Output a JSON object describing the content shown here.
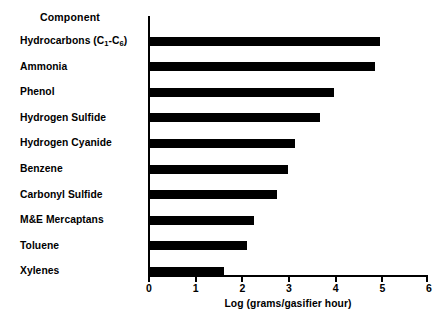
{
  "chart_data": {
    "type": "bar",
    "orientation": "horizontal",
    "title": "",
    "xlabel": "Log (grams/gasifier hour)",
    "ylabel": "Component",
    "categories": [
      "Hydrocarbons (C1-C6)",
      "Ammonia",
      "Phenol",
      "Hydrogen Sulfide",
      "Hydrogen Cyanide",
      "Benzene",
      "Carbonyl Sulfide",
      "M&E Mercaptans",
      "Toluene",
      "Xylenes"
    ],
    "values": [
      5.0,
      4.9,
      4.0,
      3.7,
      3.15,
      3.0,
      2.75,
      2.25,
      2.1,
      1.6
    ],
    "xlim": [
      0,
      6
    ],
    "xticks": [
      "0",
      "1",
      "2",
      "3",
      "4",
      "5",
      "6"
    ],
    "grid": false,
    "legend": false,
    "bar_color": "#000000",
    "background_color": "#ffffff"
  },
  "labels": {
    "component_header": "Component",
    "categories_display": [
      {
        "pre": "Hydrocarbons (C",
        "sub1": "1",
        "mid": "-C",
        "sub2": "6",
        "post": ")"
      },
      {
        "pre": "Ammonia"
      },
      {
        "pre": "Phenol"
      },
      {
        "pre": "Hydrogen Sulfide"
      },
      {
        "pre": "Hydrogen Cyanide"
      },
      {
        "pre": "Benzene"
      },
      {
        "pre": "Carbonyl Sulfide"
      },
      {
        "pre": "M&E Mercaptans"
      },
      {
        "pre": "Toluene"
      },
      {
        "pre": "Xylenes"
      }
    ]
  }
}
